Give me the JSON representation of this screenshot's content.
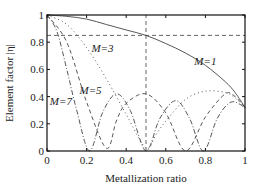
{
  "chart_data": {
    "type": "line",
    "title": "",
    "xlabel": "Metallization ratio",
    "ylabel": "Element factor |η|",
    "xlim": [
      0,
      1
    ],
    "ylim": [
      0,
      1
    ],
    "xticks": [
      "0",
      "0.2",
      "0.4",
      "0.6",
      "0.8",
      "1"
    ],
    "yticks": [
      "0",
      "0.2",
      "0.4",
      "0.6",
      "0.8",
      "1"
    ],
    "grid": false,
    "legend": "inline annotations",
    "reference_lines": [
      {
        "type": "horizontal",
        "y": 0.85,
        "style": "dashed"
      },
      {
        "type": "vertical",
        "x": 0.5,
        "style": "dashed"
      }
    ],
    "series": [
      {
        "name": "M=1",
        "style": "solid",
        "x": [
          0,
          0.1,
          0.2,
          0.3,
          0.4,
          0.5,
          0.6,
          0.7,
          0.8,
          0.9,
          0.95,
          1.0
        ],
        "values": [
          1.0,
          0.99,
          0.97,
          0.93,
          0.89,
          0.85,
          0.79,
          0.72,
          0.63,
          0.51,
          0.43,
          0.32
        ]
      },
      {
        "name": "M=3",
        "style": "dotted",
        "x": [
          0,
          0.1,
          0.2,
          0.3,
          0.4,
          0.5,
          0.55,
          0.6,
          0.7,
          0.8,
          0.9,
          0.95,
          1.0
        ],
        "values": [
          1.0,
          0.93,
          0.76,
          0.53,
          0.27,
          0.02,
          0.12,
          0.22,
          0.38,
          0.44,
          0.43,
          0.39,
          0.32
        ]
      },
      {
        "name": "M=5",
        "style": "dashed",
        "x": [
          0,
          0.1,
          0.2,
          0.3,
          0.35,
          0.4,
          0.5,
          0.6,
          0.7,
          0.8,
          0.9,
          0.95,
          1.0
        ],
        "values": [
          1.0,
          0.8,
          0.36,
          0.02,
          0.22,
          0.35,
          0.42,
          0.28,
          0.0,
          0.25,
          0.42,
          0.4,
          0.32
        ]
      },
      {
        "name": "M=7",
        "style": "dash-dot",
        "x": [
          0,
          0.05,
          0.1,
          0.15,
          0.215,
          0.28,
          0.35,
          0.42,
          0.5,
          0.57,
          0.65,
          0.72,
          0.79,
          0.86,
          0.93,
          1.0
        ],
        "values": [
          1.0,
          0.88,
          0.6,
          0.3,
          0.0,
          0.28,
          0.42,
          0.3,
          0.0,
          0.24,
          0.37,
          0.24,
          0.0,
          0.24,
          0.36,
          0.32
        ]
      }
    ],
    "annotations": [
      {
        "text": "M=1",
        "x": 0.8,
        "y": 0.63
      },
      {
        "text": "M=3",
        "x": 0.28,
        "y": 0.73
      },
      {
        "text": "M=5",
        "x": 0.22,
        "y": 0.42
      },
      {
        "text": "M=7",
        "x": 0.07,
        "y": 0.34
      }
    ]
  }
}
